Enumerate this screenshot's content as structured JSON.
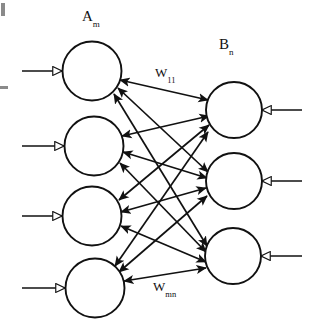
{
  "diagram": {
    "type": "bidirectional-associative-memory-network",
    "title_labels": {
      "layer_a": {
        "base": "A",
        "sub": "m"
      },
      "layer_b": {
        "base": "B",
        "sub": "n"
      }
    },
    "weight_labels": {
      "first": {
        "base": "W",
        "sub": "11"
      },
      "last": {
        "base": "W",
        "sub": "mn"
      }
    },
    "colors": {
      "stroke": "#111111",
      "background": "#ffffff",
      "arrowhead_fill": "#111111",
      "io_arrowhead_fill": "#ffffff"
    },
    "layers": {
      "a": {
        "name": "A",
        "count": 4,
        "radius": 29.5,
        "nodes": [
          {
            "id": "A1",
            "cx": 92,
            "cy": 71
          },
          {
            "id": "A2",
            "cx": 94,
            "cy": 146
          },
          {
            "id": "A3",
            "cx": 92,
            "cy": 216
          },
          {
            "id": "A4",
            "cx": 95,
            "cy": 288
          }
        ]
      },
      "b": {
        "name": "B",
        "count": 3,
        "radius": 28,
        "nodes": [
          {
            "id": "B1",
            "cx": 234,
            "cy": 110
          },
          {
            "id": "B2",
            "cx": 234,
            "cy": 181
          },
          {
            "id": "B3",
            "cx": 233,
            "cy": 256
          }
        ]
      }
    },
    "io_arrows": {
      "inputs_left": [
        {
          "id": "in-A1",
          "x1": 22,
          "y1": 71,
          "x2": 62,
          "y2": 71
        },
        {
          "id": "in-A2",
          "x1": 22,
          "y1": 146,
          "x2": 64,
          "y2": 146
        },
        {
          "id": "in-A3",
          "x1": 22,
          "y1": 216,
          "x2": 62,
          "y2": 216
        },
        {
          "id": "in-A4",
          "x1": 22,
          "y1": 288,
          "x2": 65,
          "y2": 288
        }
      ],
      "inputs_right": [
        {
          "id": "in-B1",
          "x1": 302,
          "y1": 110,
          "x2": 262,
          "y2": 110
        },
        {
          "id": "in-B2",
          "x1": 302,
          "y1": 181,
          "x2": 262,
          "y2": 181
        },
        {
          "id": "in-B3",
          "x1": 302,
          "y1": 256,
          "x2": 261,
          "y2": 256
        }
      ]
    },
    "connections": {
      "style": "bidirectional",
      "description": "every A node connects to every B node with double-headed weighted arrows",
      "pairs": [
        {
          "from": "A1",
          "to": "B1"
        },
        {
          "from": "A1",
          "to": "B2"
        },
        {
          "from": "A1",
          "to": "B3"
        },
        {
          "from": "A2",
          "to": "B1"
        },
        {
          "from": "A2",
          "to": "B2"
        },
        {
          "from": "A2",
          "to": "B3"
        },
        {
          "from": "A3",
          "to": "B1"
        },
        {
          "from": "A3",
          "to": "B2"
        },
        {
          "from": "A3",
          "to": "B3"
        },
        {
          "from": "A4",
          "to": "B1"
        },
        {
          "from": "A4",
          "to": "B2"
        },
        {
          "from": "A4",
          "to": "B3"
        }
      ]
    }
  }
}
